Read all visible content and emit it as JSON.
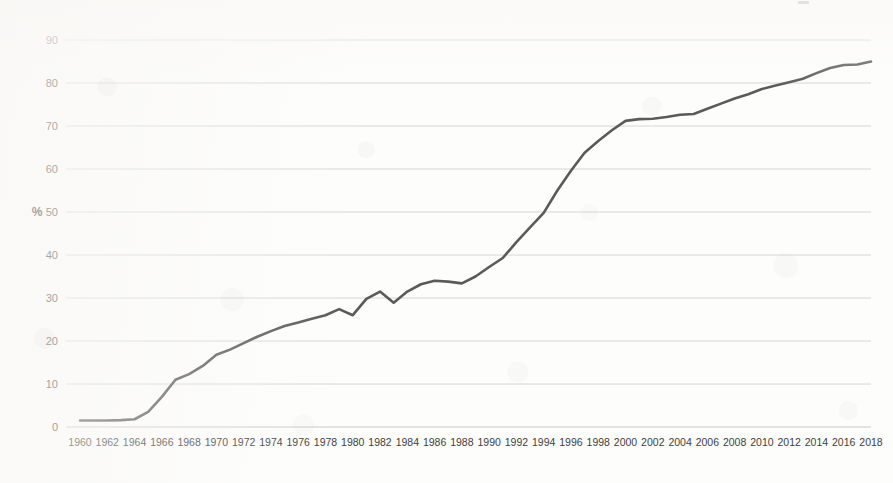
{
  "chart_data": {
    "type": "line",
    "title": "",
    "subtitle": "",
    "xlabel": "",
    "ylabel": "%",
    "ylim": [
      0,
      90
    ],
    "xlim": [
      1960,
      2018
    ],
    "y_ticks": [
      0,
      10,
      20,
      30,
      40,
      50,
      60,
      70,
      80,
      90
    ],
    "x_ticks": [
      1960,
      1962,
      1964,
      1966,
      1968,
      1970,
      1972,
      1974,
      1976,
      1978,
      1980,
      1982,
      1984,
      1986,
      1988,
      1990,
      1992,
      1994,
      1996,
      1998,
      2000,
      2002,
      2004,
      2006,
      2008,
      2010,
      2012,
      2014,
      2016,
      2018
    ],
    "grid": "horizontal",
    "legend": "none",
    "line_color": "#5a5a5a",
    "grid_color": "#d6d6d6",
    "series": [
      {
        "name": "%",
        "x": [
          1960,
          1961,
          1962,
          1963,
          1964,
          1965,
          1966,
          1967,
          1968,
          1969,
          1970,
          1971,
          1972,
          1973,
          1974,
          1975,
          1976,
          1977,
          1978,
          1979,
          1980,
          1981,
          1982,
          1983,
          1984,
          1985,
          1986,
          1987,
          1988,
          1989,
          1990,
          1991,
          1992,
          1993,
          1994,
          1995,
          1996,
          1997,
          1998,
          1999,
          2000,
          2001,
          2002,
          2003,
          2004,
          2005,
          2006,
          2007,
          2008,
          2009,
          2010,
          2011,
          2012,
          2013,
          2014,
          2015,
          2016,
          2017,
          2018
        ],
        "values": [
          1.5,
          1.5,
          1.5,
          1.6,
          1.8,
          3.5,
          7.0,
          11.0,
          12.3,
          14.2,
          16.8,
          18.0,
          19.5,
          21.0,
          22.3,
          23.5,
          24.3,
          25.2,
          26.0,
          27.4,
          26.0,
          29.8,
          31.5,
          28.9,
          31.5,
          33.2,
          34.0,
          33.8,
          33.4,
          35.0,
          37.2,
          39.3,
          43.0,
          46.4,
          49.8,
          55.0,
          59.6,
          63.8,
          66.5,
          69.0,
          71.2,
          71.6,
          71.7,
          72.1,
          72.6,
          72.8,
          74.0,
          75.2,
          76.4,
          77.4,
          78.6,
          79.4,
          80.2,
          81.0,
          82.3,
          83.5,
          84.2,
          84.3,
          85.0
        ]
      }
    ]
  },
  "axis": {
    "y_unit_label": "%"
  }
}
